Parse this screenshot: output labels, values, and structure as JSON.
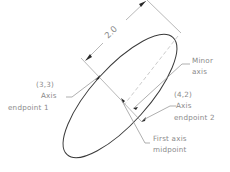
{
  "diagram": {
    "dimension_label": "2.0",
    "labels": {
      "endpoint1_coord": "(3,3)",
      "endpoint1_line1": "Axis",
      "endpoint1_line2": "endpoint 1",
      "endpoint2_coord": "(4,2)",
      "endpoint2_line1": "Axis",
      "endpoint2_line2": "endpoint 2",
      "minor_line1": "Minor",
      "minor_line2": "axis",
      "midpoint_line1": "First axis",
      "midpoint_line2": "midpoint"
    },
    "colors": {
      "ellipse": "#3a3a3a",
      "text": "#8a8a8a",
      "construction": "#9a9a9a"
    }
  }
}
